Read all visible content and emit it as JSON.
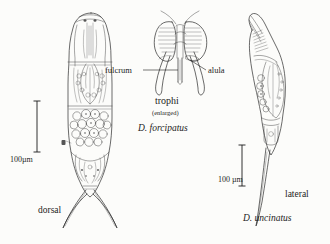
{
  "figure": {
    "background_color": "#fcfcfa",
    "ink_color": "#2b2b2b",
    "panels": [
      {
        "id": "dorsal-forcipatus",
        "view_label": "dorsal",
        "species_label": "D. forcipatus",
        "scale_label": "100µm"
      },
      {
        "id": "trophi-enlarged",
        "title": "trophi",
        "subtitle": "(enlarged)",
        "callouts": [
          "fulcrum",
          "alula"
        ]
      },
      {
        "id": "lateral-uncinatus",
        "view_label": "lateral",
        "species_label": "D. uncinatus",
        "scale_label": "100 µm"
      }
    ]
  },
  "labels": {
    "fulcrum": "fulcrum",
    "alula": "alula",
    "trophi": "trophi",
    "enlarged": "(enlarged)",
    "species_left": "D. forcipatus",
    "species_right": "D. uncinatus",
    "view_left": "dorsal",
    "view_right": "lateral",
    "scale_left": "100µm",
    "scale_right": "100 µm"
  }
}
